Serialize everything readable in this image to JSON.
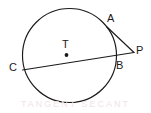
{
  "figure": {
    "type": "geometry-diagram",
    "background_color": "#ffffff",
    "stroke_color": "#1a1a1a",
    "label_color": "#1a1a1a",
    "watermark_color": "#f2e4e4",
    "watermark_text": "TANGENT SECANT"
  },
  "labels": {
    "center": "T",
    "tangent_point": "A",
    "external_point": "P",
    "near_secant_point": "B",
    "far_secant_point": "C"
  },
  "geometry": {
    "circle": {
      "cx": 69.5,
      "cy": 55.5,
      "r": 47.0
    },
    "center_dot": {
      "cx": 66.5,
      "cy": 55.0,
      "r": 1.9
    },
    "points": {
      "T": {
        "x": 66.5,
        "y": 55.0
      },
      "A": {
        "x": 107.0,
        "y": 27.0
      },
      "P": {
        "x": 134.0,
        "y": 52.5
      },
      "B": {
        "x": 113.5,
        "y": 59.5
      },
      "C": {
        "x": 22.5,
        "y": 70.0
      }
    },
    "segments": [
      {
        "name": "tangent-AP",
        "x1": 107.0,
        "y1": 27.0,
        "x2": 134.0,
        "y2": 52.5
      },
      {
        "name": "secant-CP",
        "x1": 22.5,
        "y1": 70.0,
        "x2": 134.0,
        "y2": 52.5
      }
    ],
    "stroke_width": 1.15
  }
}
